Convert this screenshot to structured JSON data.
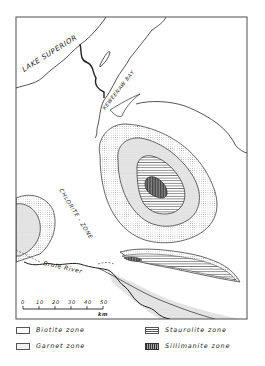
{
  "map": {
    "labels": {
      "lake_superior": "LAKE SUPERIOR",
      "keweenaw_bay": "KEWEENAW BAY",
      "chlorite_zone": "CHLORITE - ZONE",
      "brule_river": "Brule River"
    },
    "scale_bar": {
      "ticks": [
        "0",
        "10",
        "20",
        "30",
        "40",
        "50"
      ],
      "unit": "km"
    }
  },
  "legend": {
    "items": [
      {
        "label": "Biotite zone",
        "pattern": "blank"
      },
      {
        "label": "Garnet zone",
        "pattern": "stipple"
      },
      {
        "label": "Staurolite zone",
        "pattern": "horizontal-lines"
      },
      {
        "label": "Sillimanite zone",
        "pattern": "vertical-lines"
      }
    ]
  },
  "colors": {
    "line": "#2a2a2a",
    "stipple": "#8c8c8c",
    "background": "#ffffff"
  }
}
